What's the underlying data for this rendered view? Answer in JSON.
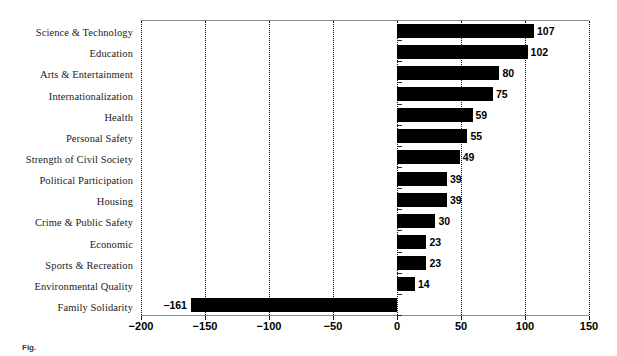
{
  "chart_data": {
    "type": "bar",
    "orientation": "horizontal",
    "title": "",
    "xlabel": "",
    "ylabel": "",
    "xlim": [
      -200,
      150
    ],
    "xticks": [
      -200,
      -150,
      -100,
      -50,
      0,
      50,
      100,
      150
    ],
    "xtick_labels": [
      "−200",
      "−150",
      "−100",
      "−50",
      "0",
      "50",
      "100",
      "150"
    ],
    "grid": true,
    "grid_axis": "x",
    "grid_style": "dotted",
    "legend": false,
    "bar_color": "#000000",
    "value_labels": true,
    "categories": [
      "Science & Technology",
      "Education",
      "Arts & Entertainment",
      "Internationalization",
      "Health",
      "Personal Safety",
      "Strength of Civil Society",
      "Political Participation",
      "Housing",
      "Crime & Public Safety",
      "Economic",
      "Sports & Recreation",
      "Environmental Quality",
      "Family Solidarity"
    ],
    "values": [
      107,
      102,
      80,
      75,
      59,
      55,
      49,
      39,
      39,
      30,
      23,
      23,
      14,
      -161
    ],
    "value_label_texts": [
      "107",
      "102",
      "80",
      "75",
      "59",
      "55",
      "49",
      "39",
      "39",
      "30",
      "23",
      "23",
      "14",
      "−161"
    ]
  },
  "caption": {
    "prefix": "Fig.",
    "text": ""
  }
}
